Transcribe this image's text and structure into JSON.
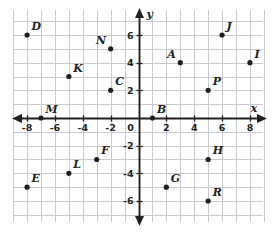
{
  "chart_data": {
    "type": "scatter",
    "title": "",
    "xlabel": "x",
    "ylabel": "y",
    "xlim": [
      -8.8,
      8.8
    ],
    "ylim": [
      -6.8,
      6.8
    ],
    "grid": true,
    "grid_step": 1,
    "legend": "none",
    "x_ticks": [
      "-8",
      "-6",
      "-4",
      "-2",
      "0",
      "2",
      "4",
      "6",
      "8"
    ],
    "x_tick_values": [
      -8,
      -6,
      -4,
      -2,
      0,
      2,
      4,
      6,
      8
    ],
    "y_ticks": [
      "6",
      "4",
      "2",
      "0",
      "-2",
      "-4",
      "-6"
    ],
    "y_tick_values": [
      6,
      4,
      2,
      0,
      -2,
      -4,
      -6
    ],
    "origin_label": "0",
    "points": [
      {
        "label": "D",
        "x": -8,
        "y": 6,
        "label_pos": "up-right"
      },
      {
        "label": "J",
        "x": 6,
        "y": 6,
        "label_pos": "up-right"
      },
      {
        "label": "N",
        "x": -2,
        "y": 5,
        "label_pos": "up-left"
      },
      {
        "label": "A",
        "x": 3,
        "y": 4,
        "label_pos": "up-left"
      },
      {
        "label": "I",
        "x": 8,
        "y": 4,
        "label_pos": "up-right"
      },
      {
        "label": "K",
        "x": -5,
        "y": 3,
        "label_pos": "up-right"
      },
      {
        "label": "C",
        "x": -2,
        "y": 2,
        "label_pos": "up-right"
      },
      {
        "label": "P",
        "x": 5,
        "y": 2,
        "label_pos": "up-right"
      },
      {
        "label": "M",
        "x": -7,
        "y": 0,
        "label_pos": "up-right"
      },
      {
        "label": "B",
        "x": 1,
        "y": 0,
        "label_pos": "up-right"
      },
      {
        "label": "F",
        "x": -3,
        "y": -3,
        "label_pos": "up-right"
      },
      {
        "label": "H",
        "x": 5,
        "y": -3,
        "label_pos": "up-right"
      },
      {
        "label": "L",
        "x": -5,
        "y": -4,
        "label_pos": "up-right"
      },
      {
        "label": "E",
        "x": -8,
        "y": -5,
        "label_pos": "up-right"
      },
      {
        "label": "G",
        "x": 2,
        "y": -5,
        "label_pos": "up-right"
      },
      {
        "label": "R",
        "x": 5,
        "y": -6,
        "label_pos": "up-right"
      }
    ]
  },
  "colors": {
    "grid": "#c9c9cf",
    "axis": "#231f20",
    "point": "#231f20",
    "background": "#ffffff"
  }
}
